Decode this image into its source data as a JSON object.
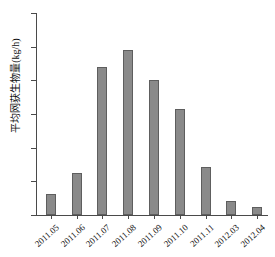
{
  "chart_data": {
    "type": "bar",
    "title": "",
    "xlabel": "",
    "ylabel": "平均网获生物量(kg/h)",
    "categories": [
      "2011.05",
      "2011.06",
      "2011.07",
      "2011.08",
      "2011.09",
      "2011.10",
      "2011.11",
      "2012.03",
      "2012.04"
    ],
    "values": [
      6.2,
      12.4,
      44.0,
      48.9,
      40.2,
      31.4,
      14.4,
      4.2,
      2.4
    ],
    "ylim": [
      0,
      60
    ],
    "yticks": [
      0,
      10,
      20,
      30,
      40,
      50,
      60
    ],
    "ytick_labels": [
      "0",
      "10",
      "20",
      "30",
      "40",
      "50",
      "60"
    ],
    "grid": false,
    "legend": null,
    "bar_color": "#8a8a8a",
    "bar_border_color": "#5e5e5e",
    "axis_color": "#4a4a4a"
  }
}
